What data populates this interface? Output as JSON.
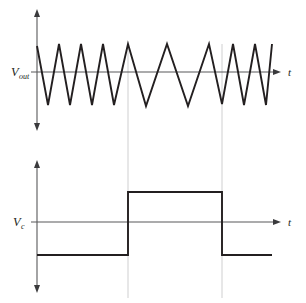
{
  "figure": {
    "title": ""
  },
  "panels": {
    "top": {
      "name": "vout-panel",
      "y_axis_label": "V",
      "y_axis_subscript": "out",
      "x_axis_label": "t",
      "axis_origin_x": 37,
      "axis_y": 72,
      "axis_top_y": 12,
      "axis_bottom_y": 128,
      "axis_right_x": 281
    },
    "bottom": {
      "name": "vc-panel",
      "y_axis_label": "V",
      "y_axis_subscript": "c",
      "x_axis_label": "t",
      "axis_origin_x": 37,
      "axis_y": 222,
      "axis_top_y": 163,
      "axis_bottom_y": 290,
      "axis_right_x": 281
    }
  },
  "chart_data": [
    {
      "type": "line",
      "name": "vout-triangle-wave",
      "title": "",
      "xlabel": "t",
      "ylabel": "V_out",
      "grid": false,
      "legend": "none",
      "zero_level": 72,
      "peak_level": 44,
      "valley_level": 103,
      "description": "Triangle wave whose period is short at left, long in the middle interval, short again at right",
      "points": [
        [
          37,
          46
        ],
        [
          48,
          105
        ],
        [
          59,
          44
        ],
        [
          70,
          105
        ],
        [
          81,
          44
        ],
        [
          92,
          105
        ],
        [
          103,
          44
        ],
        [
          114,
          105
        ],
        [
          128,
          44
        ],
        [
          146,
          106
        ],
        [
          167,
          44
        ],
        [
          188,
          106
        ],
        [
          209,
          44
        ],
        [
          222,
          104
        ],
        [
          233,
          44
        ],
        [
          244,
          105
        ],
        [
          255,
          44
        ],
        [
          266,
          105
        ],
        [
          272,
          44
        ]
      ]
    },
    {
      "type": "line",
      "name": "vc-control-wave",
      "title": "",
      "xlabel": "t",
      "ylabel": "V_c",
      "grid": false,
      "legend": "none",
      "zero_level": 222,
      "high_level": 192,
      "low_level": 255,
      "rising_edge_x": 128,
      "falling_edge_x": 222,
      "description": "Square control wave: low, then high between the two guide lines, then low again",
      "points": [
        [
          37,
          255
        ],
        [
          128,
          255
        ],
        [
          128,
          192
        ],
        [
          222,
          192
        ],
        [
          222,
          255
        ],
        [
          272,
          255
        ]
      ]
    }
  ],
  "guides": [
    {
      "name": "guide-left",
      "x": 128,
      "y_top": 44,
      "y_bottom": 298
    },
    {
      "name": "guide-right",
      "x": 222,
      "y_top": 44,
      "y_bottom": 298
    }
  ],
  "colors": {
    "waveform": "#231f20",
    "axis": "#58585a",
    "guide": "#c9c9cb",
    "background": "#ffffff"
  }
}
